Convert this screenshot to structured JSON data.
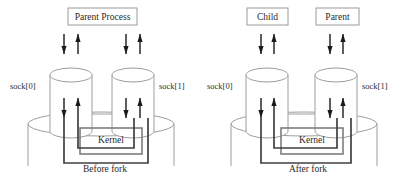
{
  "diagram": {
    "colors": {
      "background": "#ffffff",
      "box_stroke": "#9a9a9a",
      "cylinder_stroke": "#9e9e9e",
      "kernel_stroke": "#7d7d7d",
      "pipe_stroke": "#404040",
      "arrow": "#1a1a1a",
      "text": "#2b2b2b"
    },
    "panels": [
      {
        "id": "before-fork",
        "caption": "Before fork",
        "processes": [
          {
            "id": "parent-process",
            "label": "Parent Process",
            "span": "both"
          }
        ],
        "sockets": [
          {
            "id": "sock0",
            "label": "sock[0]",
            "side": "left"
          },
          {
            "id": "sock1",
            "label": "sock[1]",
            "side": "right"
          }
        ],
        "kernel": {
          "label": "Kernel"
        },
        "arrows": [
          {
            "from": "parent-process",
            "to": "sock0",
            "direction": "down"
          },
          {
            "from": "sock0",
            "to": "parent-process",
            "direction": "up"
          },
          {
            "from": "parent-process",
            "to": "sock1",
            "direction": "down"
          },
          {
            "from": "sock1",
            "to": "parent-process",
            "direction": "up"
          },
          {
            "from": "sock0",
            "to": "kernel",
            "direction": "down"
          },
          {
            "from": "kernel",
            "to": "sock0",
            "direction": "up"
          },
          {
            "from": "sock1",
            "to": "kernel",
            "direction": "down"
          },
          {
            "from": "kernel",
            "to": "sock1",
            "direction": "up"
          }
        ]
      },
      {
        "id": "after-fork",
        "caption": "After fork",
        "processes": [
          {
            "id": "child-process",
            "label": "Child",
            "span": "left"
          },
          {
            "id": "parent-process2",
            "label": "Parent",
            "span": "right"
          }
        ],
        "sockets": [
          {
            "id": "sock0b",
            "label": "sock[0]",
            "side": "left"
          },
          {
            "id": "sock1b",
            "label": "sock[1]",
            "side": "right"
          }
        ],
        "kernel": {
          "label": "Kernel"
        },
        "arrows": [
          {
            "from": "child-process",
            "to": "sock0b",
            "direction": "down"
          },
          {
            "from": "sock0b",
            "to": "child-process",
            "direction": "up"
          },
          {
            "from": "parent-process2",
            "to": "sock1b",
            "direction": "down"
          },
          {
            "from": "sock1b",
            "to": "parent-process2",
            "direction": "up"
          },
          {
            "from": "sock0b",
            "to": "kernel",
            "direction": "down"
          },
          {
            "from": "kernel",
            "to": "sock0b",
            "direction": "up"
          },
          {
            "from": "sock1b",
            "to": "kernel",
            "direction": "down"
          },
          {
            "from": "kernel",
            "to": "sock1b",
            "direction": "up"
          }
        ]
      }
    ]
  }
}
